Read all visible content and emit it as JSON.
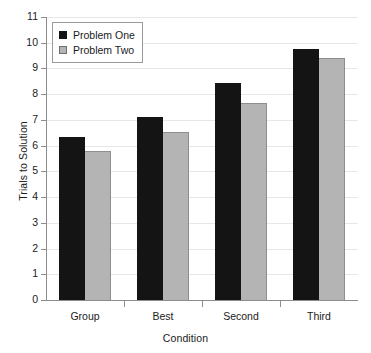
{
  "chart_data": {
    "type": "bar",
    "title": "",
    "xlabel": "Condition",
    "ylabel": "Trials to Solution",
    "categories": [
      "Group",
      "Best",
      "Second",
      "Third"
    ],
    "series": [
      {
        "name": "Problem One",
        "color": "#141414",
        "values": [
          6.35,
          7.1,
          8.45,
          9.75
        ]
      },
      {
        "name": "Problem Two",
        "color": "#b4b4b4",
        "values": [
          5.8,
          6.55,
          7.65,
          9.4
        ]
      }
    ],
    "ylim": [
      0,
      11
    ],
    "yticks": [
      0,
      1,
      2,
      3,
      4,
      5,
      6,
      7,
      8,
      9,
      10,
      11
    ],
    "ytick_labels": [
      "0",
      "1",
      "2",
      "3",
      "4",
      "5",
      "6",
      "7",
      "8",
      "9",
      "10",
      "11"
    ],
    "grid": true,
    "grid_axis": "y",
    "legend_position": "upper left",
    "legend_entries": [
      "Problem One",
      "Problem Two"
    ]
  }
}
